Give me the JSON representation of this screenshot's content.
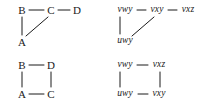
{
  "figure": {
    "background_color": "#ffffff",
    "ink_color": "#1a1a1a",
    "panels": [
      {
        "id": "top-left",
        "label_style": "upright-capitals",
        "nodes": [
          {
            "key": "b",
            "text": "B",
            "x": 22,
            "y": 10
          },
          {
            "key": "c",
            "text": "C",
            "x": 51,
            "y": 10
          },
          {
            "key": "d",
            "text": "D",
            "x": 77,
            "y": 10
          },
          {
            "key": "a",
            "text": "A",
            "x": 22,
            "y": 42
          }
        ],
        "edges": [
          {
            "from": "B",
            "to": "C",
            "x1": 29,
            "y1": 10,
            "x2": 44,
            "y2": 10
          },
          {
            "from": "C",
            "to": "D",
            "x1": 58,
            "y1": 10,
            "x2": 70,
            "y2": 10
          },
          {
            "from": "B",
            "to": "A",
            "x1": 22,
            "y1": 17,
            "x2": 22,
            "y2": 35
          },
          {
            "from": "C",
            "to": "A",
            "x1": 48,
            "y1": 17,
            "x2": 26,
            "y2": 36
          }
        ]
      },
      {
        "id": "top-right",
        "label_style": "italic-words",
        "nodes": [
          {
            "key": "vwy",
            "text": "vwy",
            "x": 23,
            "y": 10
          },
          {
            "key": "vxy",
            "text": "vxy",
            "x": 55,
            "y": 10
          },
          {
            "key": "vxz",
            "text": "vxz",
            "x": 86,
            "y": 10
          },
          {
            "key": "uwy",
            "text": "uwy",
            "x": 23,
            "y": 41
          }
        ],
        "edges": [
          {
            "from": "vwy",
            "to": "vxy",
            "x1": 35,
            "y1": 10,
            "x2": 44,
            "y2": 10
          },
          {
            "from": "vxy",
            "to": "vxz",
            "x1": 66,
            "y1": 10,
            "x2": 75,
            "y2": 10
          },
          {
            "from": "vwy",
            "to": "uwy",
            "x1": 18,
            "y1": 17,
            "x2": 18,
            "y2": 34
          },
          {
            "from": "vxy",
            "to": "uwy",
            "x1": 52,
            "y1": 17,
            "x2": 30,
            "y2": 36
          }
        ]
      },
      {
        "id": "bottom-left",
        "label_style": "upright-capitals",
        "nodes": [
          {
            "key": "b",
            "text": "B",
            "x": 22,
            "y": 11
          },
          {
            "key": "d",
            "text": "D",
            "x": 51,
            "y": 11
          },
          {
            "key": "a",
            "text": "A",
            "x": 22,
            "y": 40
          },
          {
            "key": "c",
            "text": "C",
            "x": 51,
            "y": 40
          }
        ],
        "edges": [
          {
            "from": "B",
            "to": "D",
            "x1": 29,
            "y1": 11,
            "x2": 44,
            "y2": 11
          },
          {
            "from": "A",
            "to": "C",
            "x1": 29,
            "y1": 40,
            "x2": 44,
            "y2": 40
          },
          {
            "from": "B",
            "to": "A",
            "x1": 22,
            "y1": 18,
            "x2": 22,
            "y2": 33
          },
          {
            "from": "D",
            "to": "C",
            "x1": 51,
            "y1": 18,
            "x2": 51,
            "y2": 33
          }
        ]
      },
      {
        "id": "bottom-right",
        "label_style": "italic-words",
        "nodes": [
          {
            "key": "vwy",
            "text": "vwy",
            "x": 23,
            "y": 11
          },
          {
            "key": "vxz",
            "text": "vxz",
            "x": 57,
            "y": 11
          },
          {
            "key": "uwy",
            "text": "uwy",
            "x": 23,
            "y": 40
          },
          {
            "key": "vxy",
            "text": "vxy",
            "x": 57,
            "y": 40
          }
        ],
        "edges": [
          {
            "from": "vwy",
            "to": "vxz",
            "x1": 35,
            "y1": 11,
            "x2": 46,
            "y2": 11
          },
          {
            "from": "uwy",
            "to": "vxy",
            "x1": 36,
            "y1": 40,
            "x2": 46,
            "y2": 40
          },
          {
            "from": "vwy",
            "to": "uwy",
            "x1": 18,
            "y1": 18,
            "x2": 18,
            "y2": 33
          },
          {
            "from": "vxz",
            "to": "vxy",
            "x1": 58,
            "y1": 18,
            "x2": 58,
            "y2": 33
          }
        ]
      }
    ]
  }
}
